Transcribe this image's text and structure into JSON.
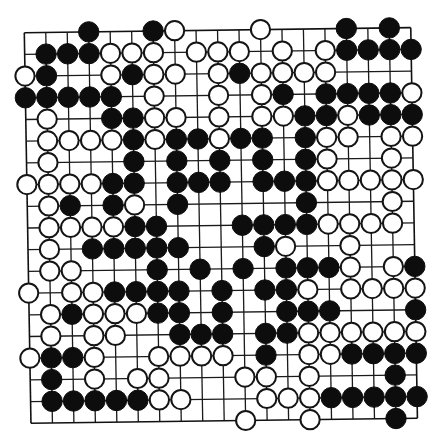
{
  "diagram": {
    "type": "go-board",
    "size": 19,
    "legend": {
      "B": "black stone",
      "W": "white stone",
      ".": "empty intersection"
    },
    "colors": {
      "black_stone": "#0d0d0d",
      "white_stone": "#ffffff",
      "line": "#1a1a1a",
      "background": "#ffffff"
    },
    "rows": [
      "...B..BW...W...B.B.",
      ".BBBWWW.WWW.W.WBBBB",
      "WB..WBWW.WBWWWW....",
      "BBBBB.W..W.WB.BBBBW",
      ".W..BBWW.W.WWBBWBBB",
      ".WWWWBWBBWBB.BWW.WW",
      ".W...B.B.B.B.BW..W.",
      "WWWWBB.BBB.BBBWWWWW",
      ".WB.BW.B.....B...W.",
      ".WWWWBB...BBBBWWWW.",
      ".W.BBBBB...BW..W...",
      ".WW...B.B.B.BBBW.WB",
      "W.WWBBBB.B.BBW.WWWW",
      ".WBWWWBB.B..BBB...B",
      ".W.WW..BBB.BBWWWWWW",
      "WBBW..WWWW.B.WWBBBB",
      ".B.W.WW...WW.W...B.",
      ".BBBBBWW...WWWBBBBB",
      "..........W..W...B."
    ]
  },
  "geometry": {
    "origin": [
      24.3,
      32.7
    ],
    "col_step": [
      21.47,
      -0.28
    ],
    "row_step": [
      0.37,
      21.7
    ],
    "stone_radius": 10.2
  }
}
